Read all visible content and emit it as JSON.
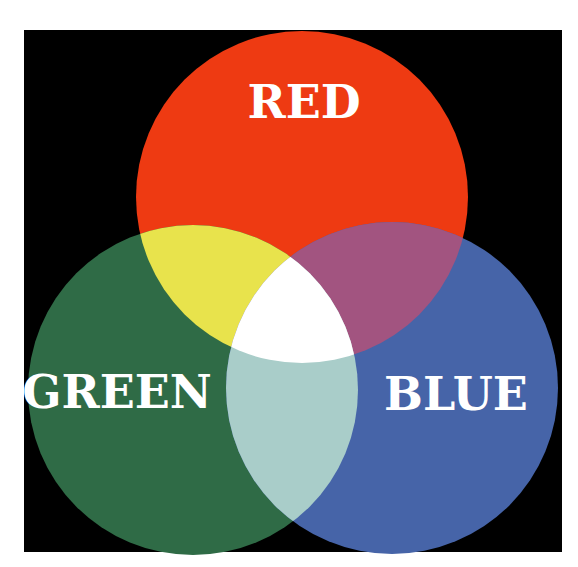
{
  "diagram": {
    "type": "venn-additive-color",
    "background_color": "#000000",
    "page_color": "#ffffff",
    "circles": [
      {
        "name": "red",
        "label": "RED",
        "color": "#ee3a12",
        "cx": 302,
        "cy": 197,
        "r": 166,
        "label_x": 304,
        "label_y": 118
      },
      {
        "name": "green",
        "label": "GREEN",
        "color": "#2f6b46",
        "cx": 193,
        "cy": 390,
        "r": 165,
        "label_x": 117,
        "label_y": 408
      },
      {
        "name": "blue",
        "label": "BLUE",
        "color": "#4664a8",
        "cx": 392,
        "cy": 388,
        "r": 166,
        "label_x": 456,
        "label_y": 410
      }
    ],
    "overlaps": {
      "red_green": "#e8e34c",
      "red_blue": "#a25480",
      "green_blue": "#a9cdc9",
      "all": "#ffffff"
    }
  }
}
